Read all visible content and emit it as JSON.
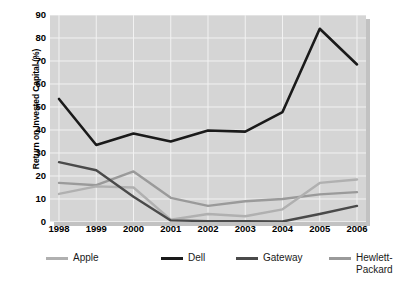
{
  "chart_data": {
    "type": "line",
    "title": "",
    "xlabel": "",
    "ylabel": "Return on Invested Capital (%)",
    "categories": [
      "1998",
      "1999",
      "2000",
      "2001",
      "2002",
      "2003",
      "2004",
      "2005",
      "2006"
    ],
    "x": [
      1998,
      1999,
      2000,
      2001,
      2002,
      2003,
      2004,
      2005,
      2006
    ],
    "ylim": [
      0,
      90
    ],
    "yticks": [
      0,
      10,
      20,
      30,
      40,
      50,
      60,
      70,
      80,
      90
    ],
    "ytick_labels": [
      "0",
      "10",
      "20",
      "30",
      "40",
      "50",
      "60",
      "70",
      "80",
      "90"
    ],
    "grid": true,
    "legend_position": "bottom",
    "series": [
      {
        "name": "Apple",
        "color": "#b0b0b0",
        "values": [
          12.2,
          15.5,
          15.0,
          1.0,
          3.5,
          2.5,
          5.5,
          17.0,
          18.5
        ]
      },
      {
        "name": "Dell",
        "color": "#1a1a1a",
        "values": [
          53.5,
          33.5,
          38.5,
          35.0,
          39.8,
          39.3,
          47.8,
          84.0,
          68.5
        ]
      },
      {
        "name": "Gateway",
        "color": "#4a4a4a",
        "values": [
          26.0,
          22.5,
          11.0,
          0.7,
          0.4,
          0.3,
          0.2,
          3.5,
          7.0
        ]
      },
      {
        "name": "Hewlett-Packard",
        "color": "#9a9a9a",
        "values": [
          17.0,
          16.0,
          22.0,
          10.5,
          7.0,
          9.0,
          10.0,
          12.0,
          13.0
        ]
      }
    ]
  },
  "legend": {
    "items": [
      {
        "label": "Apple",
        "color": "#b0b0b0"
      },
      {
        "label": "Dell",
        "color": "#1a1a1a"
      },
      {
        "label": "Gateway",
        "color": "#4a4a4a"
      },
      {
        "label": "Hewlett-\nPackard",
        "color": "#9a9a9a"
      }
    ]
  },
  "style": {
    "plot_background": "#d5d5d5",
    "gridline_color": "#f2f2f2",
    "axis_color": "#3a3a3a",
    "page_background": "#ffffff"
  }
}
